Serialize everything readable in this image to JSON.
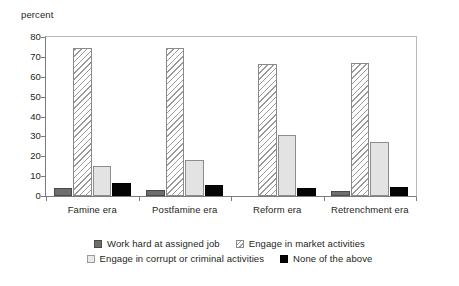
{
  "chart_data": {
    "type": "bar",
    "title": "",
    "xlabel": "",
    "ylabel": "percent",
    "ylim": [
      0,
      80
    ],
    "yticks": [
      0,
      10,
      20,
      30,
      40,
      50,
      60,
      70,
      80
    ],
    "grid": false,
    "legend_position": "bottom",
    "categories": [
      "Famine era",
      "Postfamine era",
      "Reform era",
      "Retrenchment era"
    ],
    "series": [
      {
        "name": "Work hard at assigned job",
        "color": "#6e6e6e",
        "pattern": "solid-dark-gray",
        "values": [
          4,
          3,
          0,
          2.5
        ]
      },
      {
        "name": "Engage in market activities",
        "color": "#ffffff",
        "pattern": "diagonal-hatch",
        "values": [
          74.5,
          74.5,
          66.5,
          67
        ]
      },
      {
        "name": "Engage in corrupt or criminal activities",
        "color": "#e3e3e3",
        "pattern": "solid-light-gray",
        "values": [
          15,
          18,
          30.5,
          27
        ]
      },
      {
        "name": "None of the above",
        "color": "#050505",
        "pattern": "solid-black",
        "values": [
          6.5,
          5.5,
          4,
          4.5
        ]
      }
    ]
  },
  "axis": {
    "y_title": "percent"
  },
  "legend": {
    "rows": [
      [
        "Work hard at assigned job",
        "Engage in market activities"
      ],
      [
        "Engage in corrupt or criminal activities",
        "None of the above"
      ]
    ]
  }
}
